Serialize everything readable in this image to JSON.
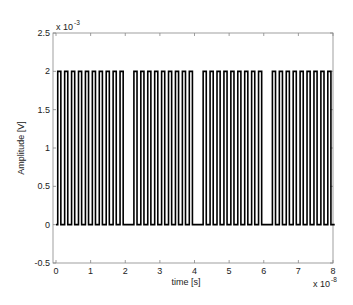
{
  "chart_data": {
    "type": "line",
    "title": "",
    "xlabel": "time [s]",
    "ylabel": "Amplitude [V]",
    "x_scale_label": "x 10",
    "x_scale_exponent": "-8",
    "y_scale_label": "x 10",
    "y_scale_exponent": "-3",
    "xlim": [
      -0.1,
      8.1
    ],
    "ylim": [
      -0.5,
      2.5
    ],
    "xticks": [
      0,
      1,
      2,
      3,
      4,
      5,
      6,
      7,
      8
    ],
    "xtick_labels": [
      "0",
      "1",
      "2",
      "3",
      "4",
      "5",
      "6",
      "7",
      "8"
    ],
    "yticks": [
      -0.5,
      0,
      0.5,
      1,
      1.5,
      2,
      2.5
    ],
    "ytick_labels": [
      "-0.5",
      "0",
      "0.5",
      "1",
      "1.5",
      "2",
      "2.5"
    ],
    "grid": false,
    "legend": null,
    "series": [
      {
        "name": "pulse train",
        "color": "#000000",
        "low_level": 0,
        "high_level": 2,
        "slot_period": 0.2,
        "pulse_width": 0.09,
        "pulse_start_times": [
          0.05,
          0.25,
          0.45,
          0.65,
          0.85,
          1.05,
          1.25,
          1.45,
          1.65,
          1.85,
          2.25,
          2.45,
          2.65,
          2.85,
          3.05,
          3.25,
          3.45,
          3.65,
          3.85,
          4.25,
          4.45,
          4.65,
          4.85,
          5.05,
          5.25,
          5.45,
          5.65,
          5.85,
          6.25,
          6.45,
          6.65,
          6.85,
          7.05,
          7.25,
          7.45,
          7.65,
          7.85
        ]
      }
    ]
  }
}
